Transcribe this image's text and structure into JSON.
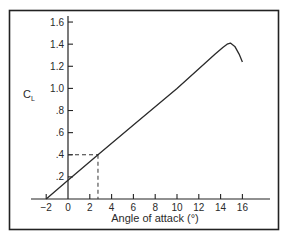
{
  "chart_data": {
    "type": "line",
    "title": "",
    "xlabel": "Angle of attack (°)",
    "ylabel": "C_L",
    "ylabel_main": "C",
    "ylabel_sub": "L",
    "xlim": [
      -2,
      16
    ],
    "ylim": [
      0,
      1.6
    ],
    "grid": false,
    "legend": null,
    "x_ticks": [
      -2,
      0,
      2,
      4,
      6,
      8,
      10,
      12,
      14,
      16
    ],
    "x_tick_labels": [
      "−2",
      "0",
      "2",
      "4",
      "6",
      "8",
      "10",
      "12",
      "14",
      "16"
    ],
    "y_ticks": [
      0.2,
      0.4,
      0.6,
      0.8,
      1.0,
      1.2,
      1.4,
      1.6
    ],
    "y_tick_labels": [
      ".2",
      ".4",
      ".6",
      ".8",
      "1.0",
      "1.2",
      "1.4",
      "1.6"
    ],
    "series": [
      {
        "name": "Lift coefficient",
        "x": [
          -2,
          0,
          2.75,
          6,
          10,
          13.5,
          14.2,
          14.6,
          14.9,
          15.3,
          15.7,
          16.0
        ],
        "values": [
          0,
          0.17,
          0.4,
          0.67,
          1.0,
          1.31,
          1.37,
          1.4,
          1.41,
          1.38,
          1.31,
          1.24
        ]
      }
    ],
    "annotations": [
      {
        "type": "dashed-guide",
        "x": 2.75,
        "y": 0.4,
        "description": "Dashed lines marking CL = 0.4 at ~2.75° angle of attack"
      }
    ],
    "colors": {
      "line": "#2a2a2a",
      "frame": "#222222",
      "background": "#ffffff"
    }
  }
}
